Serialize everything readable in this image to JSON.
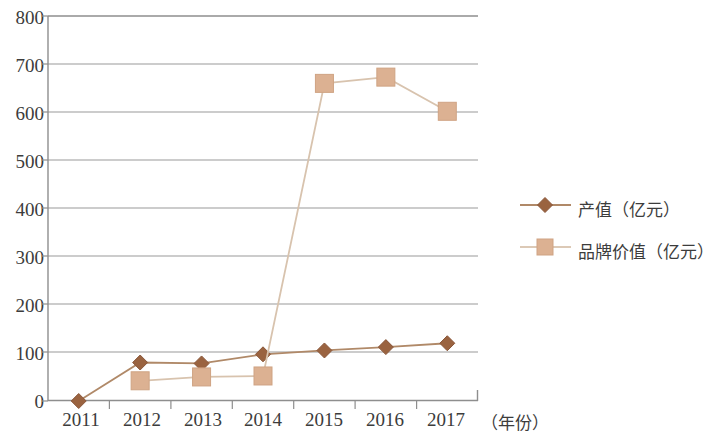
{
  "chart_data": {
    "type": "line",
    "title": "",
    "subtitle": "",
    "xlabel": "（年份）",
    "ylabel": "",
    "categories": [
      "2011",
      "2012",
      "2013",
      "2014",
      "2015",
      "2016",
      "2017"
    ],
    "ylim": [
      0,
      800
    ],
    "yticks": [
      "0",
      "100",
      "200",
      "300",
      "400",
      "500",
      "600",
      "700",
      "800"
    ],
    "grid": "horizontal",
    "legend_position": "right",
    "series": [
      {
        "name": "产值（亿元）",
        "marker": "diamond",
        "color": "#9a6340",
        "line_color": "#b08968",
        "values": [
          0,
          80,
          78,
          97,
          105,
          112,
          120
        ]
      },
      {
        "name": "品牌价值（亿元）",
        "marker": "square",
        "color": "#dcb192",
        "line_color": "#d8c3ae",
        "values": [
          null,
          42,
          50,
          52,
          660,
          673,
          602
        ]
      }
    ]
  },
  "axis": {
    "x_label": "（年份）",
    "tick_labels_x": [
      "2011",
      "2012",
      "2013",
      "2014",
      "2015",
      "2016",
      "2017"
    ],
    "tick_labels_y": [
      "800",
      "700",
      "600",
      "500",
      "400",
      "300",
      "200",
      "100",
      "0"
    ]
  },
  "legend": {
    "items": [
      {
        "label": "产值（亿元）",
        "marker": "diamond",
        "color": "#9a6340"
      },
      {
        "label": "品牌价值（亿元）",
        "marker": "square",
        "color": "#dcb192"
      }
    ]
  },
  "colors": {
    "grid": "#9a9a9a",
    "axis": "#8c8c8c",
    "series_1": "#9a6340",
    "series_1_line": "#b08968",
    "series_2": "#dcb192",
    "series_2_line": "#d9c6b2",
    "text": "#3c3c3c",
    "background": "#ffffff"
  }
}
